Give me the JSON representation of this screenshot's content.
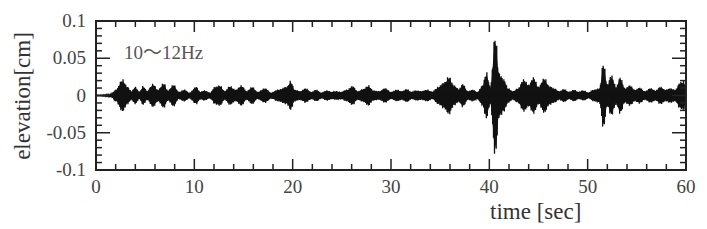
{
  "chart_data": {
    "type": "line",
    "title": "",
    "annotation": "10〜12Hz",
    "xlabel": "time [sec]",
    "ylabel": "elevation[cm]",
    "xlim": [
      0,
      60
    ],
    "ylim": [
      -0.1,
      0.1
    ],
    "xticks": [
      0,
      10,
      20,
      30,
      40,
      50,
      60
    ],
    "xtick_labels": [
      "0",
      "10",
      "20",
      "30",
      "40",
      "50",
      "60"
    ],
    "yticks": [
      0.1,
      0.05,
      0,
      -0.05,
      -0.1
    ],
    "ytick_labels": [
      "0.1",
      "0.05",
      "0",
      "-0.05",
      "-0.1"
    ],
    "grid": false,
    "legend": null,
    "series": [
      {
        "name": "10~12Hz band-passed elevation",
        "color": "#111111",
        "description": "band-passed oscillation envelope (amplitude vs time)",
        "envelope": [
          [
            0,
            0
          ],
          [
            1.5,
            0.001
          ],
          [
            2.0,
            0.008
          ],
          [
            2.7,
            0.022
          ],
          [
            3.2,
            0.012
          ],
          [
            3.6,
            0.006
          ],
          [
            4.0,
            0.012
          ],
          [
            4.4,
            0.005
          ],
          [
            4.8,
            0.013
          ],
          [
            5.2,
            0.006
          ],
          [
            5.8,
            0.016
          ],
          [
            6.3,
            0.008
          ],
          [
            6.9,
            0.017
          ],
          [
            7.3,
            0.007
          ],
          [
            7.9,
            0.015
          ],
          [
            8.4,
            0.005
          ],
          [
            9.0,
            0.008
          ],
          [
            9.5,
            0.004
          ],
          [
            10.2,
            0.012
          ],
          [
            10.6,
            0.005
          ],
          [
            11.0,
            0.007
          ],
          [
            11.6,
            0.004
          ],
          [
            12.1,
            0.012
          ],
          [
            12.6,
            0.014
          ],
          [
            13.1,
            0.006
          ],
          [
            13.6,
            0.013
          ],
          [
            14.2,
            0.008
          ],
          [
            14.8,
            0.014
          ],
          [
            15.3,
            0.006
          ],
          [
            15.9,
            0.012
          ],
          [
            16.4,
            0.005
          ],
          [
            17.2,
            0.01
          ],
          [
            17.8,
            0.004
          ],
          [
            18.5,
            0.008
          ],
          [
            19.4,
            0.012
          ],
          [
            19.8,
            0.02
          ],
          [
            20.2,
            0.008
          ],
          [
            20.8,
            0.006
          ],
          [
            21.3,
            0.01
          ],
          [
            21.9,
            0.005
          ],
          [
            22.4,
            0.008
          ],
          [
            22.9,
            0.004
          ],
          [
            23.5,
            0.007
          ],
          [
            24.0,
            0.005
          ],
          [
            24.4,
            0.006
          ],
          [
            24.9,
            0.005
          ],
          [
            25.5,
            0.008
          ],
          [
            26.1,
            0.013
          ],
          [
            26.6,
            0.006
          ],
          [
            27.2,
            0.009
          ],
          [
            27.7,
            0.014
          ],
          [
            28.2,
            0.007
          ],
          [
            28.8,
            0.006
          ],
          [
            29.4,
            0.01
          ],
          [
            30.0,
            0.005
          ],
          [
            30.6,
            0.008
          ],
          [
            31.1,
            0.006
          ],
          [
            31.6,
            0.009
          ],
          [
            32.1,
            0.005
          ],
          [
            32.6,
            0.007
          ],
          [
            33.1,
            0.006
          ],
          [
            33.7,
            0.008
          ],
          [
            34.2,
            0.005
          ],
          [
            34.8,
            0.012
          ],
          [
            35.4,
            0.018
          ],
          [
            35.9,
            0.026
          ],
          [
            36.4,
            0.014
          ],
          [
            36.9,
            0.009
          ],
          [
            37.3,
            0.016
          ],
          [
            37.8,
            0.006
          ],
          [
            38.3,
            0.008
          ],
          [
            38.8,
            0.005
          ],
          [
            39.3,
            0.014
          ],
          [
            39.7,
            0.032
          ],
          [
            40.1,
            0.012
          ],
          [
            40.6,
            0.083
          ],
          [
            41.0,
            0.03
          ],
          [
            41.5,
            0.022
          ],
          [
            41.9,
            0.01
          ],
          [
            42.4,
            0.006
          ],
          [
            42.9,
            0.01
          ],
          [
            43.5,
            0.022
          ],
          [
            44.0,
            0.015
          ],
          [
            44.5,
            0.025
          ],
          [
            45.0,
            0.012
          ],
          [
            45.6,
            0.024
          ],
          [
            46.1,
            0.013
          ],
          [
            46.6,
            0.01
          ],
          [
            47.1,
            0.006
          ],
          [
            47.6,
            0.009
          ],
          [
            48.1,
            0.005
          ],
          [
            48.6,
            0.008
          ],
          [
            49.1,
            0.005
          ],
          [
            49.6,
            0.007
          ],
          [
            50.1,
            0.004
          ],
          [
            50.6,
            0.008
          ],
          [
            51.2,
            0.01
          ],
          [
            51.6,
            0.045
          ],
          [
            52.0,
            0.015
          ],
          [
            52.4,
            0.028
          ],
          [
            52.9,
            0.012
          ],
          [
            53.3,
            0.025
          ],
          [
            53.8,
            0.01
          ],
          [
            54.3,
            0.014
          ],
          [
            54.8,
            0.008
          ],
          [
            55.3,
            0.011
          ],
          [
            55.8,
            0.006
          ],
          [
            56.4,
            0.01
          ],
          [
            56.9,
            0.007
          ],
          [
            57.4,
            0.012
          ],
          [
            57.9,
            0.008
          ],
          [
            58.4,
            0.01
          ],
          [
            58.9,
            0.008
          ],
          [
            59.4,
            0.018
          ],
          [
            59.8,
            0.02
          ],
          [
            60.0,
            0.008
          ]
        ]
      }
    ]
  }
}
